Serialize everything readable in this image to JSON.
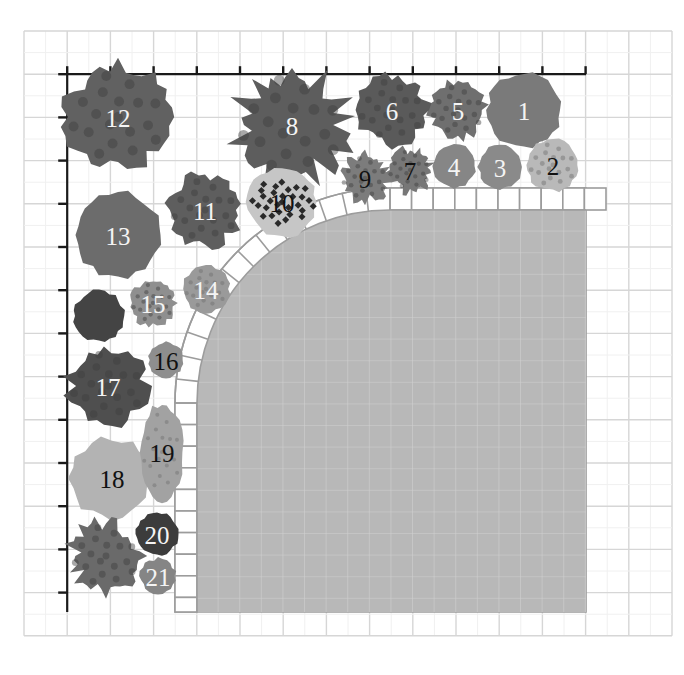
{
  "diagram": {
    "type": "garden-planting-plan",
    "grid": {
      "cols": 15,
      "rows": 14,
      "cell_px": 43.2,
      "origin": [
        24,
        31
      ]
    },
    "colors": {
      "grid_line": "#d6d6d6",
      "patio_fill": "#b8b8b8",
      "patio_grid": "#d2d2d2",
      "paver_stroke": "#9c9c9c",
      "axis": "#1a1a1a"
    },
    "patio": {
      "label": "",
      "x": 197,
      "y": 210,
      "right": 586,
      "bottom": 612,
      "corner_radius": 193,
      "paver_width": 22
    },
    "plants": [
      {
        "id": "1",
        "label": "1",
        "cx": 524,
        "cy": 110,
        "r": 38,
        "color": "#7a7a7a",
        "style": "solid",
        "text": "light"
      },
      {
        "id": "2",
        "label": "2",
        "cx": 553,
        "cy": 165,
        "r": 27,
        "color": "#b9b9b9",
        "style": "speckle",
        "text": "dark"
      },
      {
        "id": "3",
        "label": "3",
        "cx": 500,
        "cy": 167,
        "r": 22,
        "color": "#8a8a8a",
        "style": "lobed",
        "text": "light"
      },
      {
        "id": "4",
        "label": "4",
        "cx": 454,
        "cy": 166,
        "r": 22,
        "color": "#868686",
        "style": "lobed",
        "text": "light"
      },
      {
        "id": "5",
        "label": "5",
        "cx": 458,
        "cy": 110,
        "r": 30,
        "color": "#6f6f6f",
        "style": "leafy",
        "text": "light"
      },
      {
        "id": "6",
        "label": "6",
        "cx": 392,
        "cy": 110,
        "r": 37,
        "color": "#5a5a5a",
        "style": "leafy",
        "text": "light"
      },
      {
        "id": "7",
        "label": "7",
        "cx": 410,
        "cy": 170,
        "r": 24,
        "color": "#777777",
        "style": "spiky",
        "text": "dark"
      },
      {
        "id": "8",
        "label": "8",
        "cx": 292,
        "cy": 125,
        "r": 60,
        "color": "#5d5d5d",
        "style": "spiky",
        "text": "light"
      },
      {
        "id": "9",
        "label": "9",
        "cx": 365,
        "cy": 178,
        "r": 26,
        "color": "#7c7c7c",
        "style": "spiky",
        "text": "dark"
      },
      {
        "id": "10",
        "label": "10",
        "cx": 282,
        "cy": 202,
        "r": 36,
        "color": "#c6c6c6",
        "style": "dotted",
        "text": "dark"
      },
      {
        "id": "11",
        "label": "11",
        "cx": 205,
        "cy": 210,
        "r": 38,
        "color": "#5e5e5e",
        "style": "leafy",
        "text": "light"
      },
      {
        "id": "12",
        "label": "12",
        "cx": 118,
        "cy": 117,
        "r": 55,
        "color": "#616161",
        "style": "leafy",
        "text": "light"
      },
      {
        "id": "13",
        "label": "13",
        "cx": 118,
        "cy": 235,
        "r": 44,
        "color": "#6c6c6c",
        "style": "solid",
        "text": "light"
      },
      {
        "id": "14",
        "label": "14",
        "cx": 206,
        "cy": 289,
        "r": 24,
        "color": "#9a9a9a",
        "style": "speckle",
        "text": "light"
      },
      {
        "id": "15",
        "label": "15",
        "cx": 153,
        "cy": 303,
        "r": 24,
        "color": "#8f8f8f",
        "style": "leafy",
        "text": "light"
      },
      {
        "id": "u1",
        "label": "",
        "cx": 99,
        "cy": 316,
        "r": 26,
        "color": "#444444",
        "style": "solid",
        "text": "light"
      },
      {
        "id": "16",
        "label": "16",
        "cx": 166,
        "cy": 360,
        "r": 18,
        "color": "#8e8e8e",
        "style": "solid",
        "text": "dark"
      },
      {
        "id": "17",
        "label": "17",
        "cx": 108,
        "cy": 386,
        "r": 42,
        "color": "#4f4f4f",
        "style": "flower",
        "text": "light"
      },
      {
        "id": "18",
        "label": "18",
        "cx": 112,
        "cy": 478,
        "r": 42,
        "color": "#b3b3b3",
        "style": "lobed",
        "text": "dark"
      },
      {
        "id": "19",
        "label": "19",
        "cx": 162,
        "cy": 452,
        "r": 22,
        "color": "#a2a2a2",
        "style": "speckle",
        "text": "dark",
        "ry": 50
      },
      {
        "id": "u2",
        "label": "",
        "cx": 106,
        "cy": 556,
        "r": 38,
        "color": "#6a6a6a",
        "style": "spiky",
        "text": "light"
      },
      {
        "id": "20",
        "label": "20",
        "cx": 157,
        "cy": 534,
        "r": 22,
        "color": "#3c3c3c",
        "style": "solid",
        "text": "light"
      },
      {
        "id": "21",
        "label": "21",
        "cx": 158,
        "cy": 576,
        "r": 18,
        "color": "#858585",
        "style": "lobed",
        "text": "light"
      }
    ]
  }
}
